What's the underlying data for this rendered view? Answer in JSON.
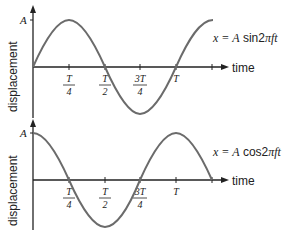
{
  "graphs": [
    {
      "id": "sine",
      "equation": {
        "x": "x",
        "eq": "= ",
        "A": "A",
        "fn": " sin2",
        "pi": "π",
        "rest": "ft"
      },
      "y_axis_label": "displacement",
      "x_axis_label": "time",
      "amplitude_label": "A",
      "ticks": [
        {
          "num": "T",
          "den": "4"
        },
        {
          "num": "T",
          "den": "2"
        },
        {
          "num": "3T",
          "den": "4"
        },
        {
          "num": "T",
          "den": ""
        }
      ]
    },
    {
      "id": "cosine",
      "equation": {
        "x": "x",
        "eq": "= ",
        "A": "A",
        "fn": " cos2",
        "pi": "π",
        "rest": "ft"
      },
      "y_axis_label": "displacement",
      "x_axis_label": "time",
      "amplitude_label": "A",
      "ticks": [
        {
          "num": "T",
          "den": "4"
        },
        {
          "num": "T",
          "den": "2"
        },
        {
          "num": "3T",
          "den": "4"
        },
        {
          "num": "T",
          "den": ""
        }
      ]
    }
  ],
  "colors": {
    "curve": "#6b6b6b",
    "axis": "#222222",
    "text": "#222222"
  }
}
